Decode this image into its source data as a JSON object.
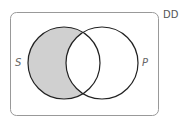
{
  "diagram": {
    "type": "venn",
    "corner_label": "DD",
    "sets": [
      {
        "name": "S",
        "label": "S"
      },
      {
        "name": "P",
        "label": "P"
      }
    ],
    "shaded_region": "S only (S minus P)",
    "colors": {
      "shade": "#d0d0d0",
      "stroke": "#222222",
      "frame": "#999999"
    }
  }
}
